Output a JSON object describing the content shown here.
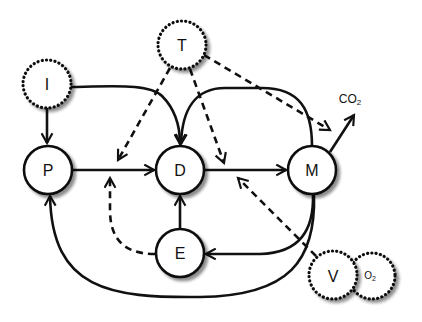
{
  "diagram": {
    "nodes": [
      {
        "id": "I",
        "label": "I",
        "style": "dotted"
      },
      {
        "id": "T",
        "label": "T",
        "style": "dotted"
      },
      {
        "id": "P",
        "label": "P",
        "style": "solid"
      },
      {
        "id": "D",
        "label": "D",
        "style": "solid"
      },
      {
        "id": "M",
        "label": "M",
        "style": "solid"
      },
      {
        "id": "E",
        "label": "E",
        "style": "solid"
      },
      {
        "id": "V",
        "label": "V",
        "style": "dotted"
      },
      {
        "id": "O2",
        "label": "O",
        "subscript": "2",
        "style": "dotted"
      }
    ],
    "output_label": {
      "text": "CO",
      "subscript": "2"
    },
    "edges": [
      {
        "from": "I",
        "to": "P",
        "style": "solid"
      },
      {
        "from": "I",
        "to": "D",
        "style": "solid"
      },
      {
        "from": "P",
        "to": "D",
        "style": "solid"
      },
      {
        "from": "D",
        "to": "M",
        "style": "solid"
      },
      {
        "from": "M",
        "to": "D",
        "style": "solid"
      },
      {
        "from": "E",
        "to": "D",
        "style": "solid"
      },
      {
        "from": "M",
        "to": "E",
        "style": "solid"
      },
      {
        "from": "M",
        "to": "P",
        "style": "solid"
      },
      {
        "from": "M",
        "to": "CO2",
        "style": "solid"
      },
      {
        "from": "T",
        "to": "P->D",
        "style": "dashed"
      },
      {
        "from": "T",
        "to": "D->M",
        "style": "dashed"
      },
      {
        "from": "T",
        "to": "M->CO2",
        "style": "dashed"
      },
      {
        "from": "E",
        "to": "P->D",
        "style": "dashed"
      },
      {
        "from": "V",
        "to": "D->M",
        "style": "dashed"
      }
    ]
  }
}
